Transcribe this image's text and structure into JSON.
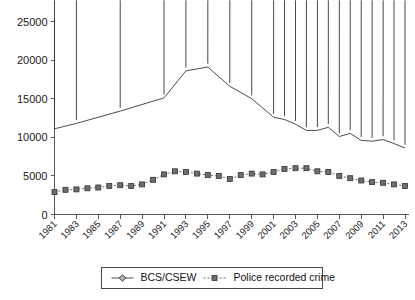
{
  "chart_data": {
    "type": "line",
    "title": "",
    "subtitle": "",
    "xlabel": "",
    "ylabel": "",
    "ylim": [
      0,
      25000
    ],
    "ytick_labels": [
      "0",
      "5000",
      "10000",
      "15000",
      "20000",
      "25000"
    ],
    "ytick_values": [
      0,
      5000,
      10000,
      15000,
      20000,
      25000
    ],
    "grid": false,
    "legend_position": "bottom-center",
    "x": [
      1981,
      1982,
      1983,
      1984,
      1985,
      1986,
      1987,
      1988,
      1989,
      1990,
      1991,
      1992,
      1993,
      1994,
      1995,
      1996,
      1997,
      1998,
      1999,
      2000,
      2001,
      2002,
      2003,
      2004,
      2005,
      2006,
      2007,
      2008,
      2009,
      2010,
      2011,
      2012,
      2013
    ],
    "xtick_labels": [
      "1981",
      "1983",
      "1985",
      "1987",
      "1989",
      "1991",
      "1993",
      "1995",
      "1997",
      "1999",
      "2001",
      "2003",
      "2005",
      "2007",
      "2009",
      "2011",
      "2013"
    ],
    "xtick_values": [
      1981,
      1983,
      1985,
      1987,
      1989,
      1991,
      1993,
      1995,
      1997,
      1999,
      2001,
      2003,
      2005,
      2007,
      2009,
      2011,
      2013
    ],
    "series": [
      {
        "name": "BCS/CSEW",
        "marker": "diamond",
        "line_style": "solid",
        "color": "#4d4d4d",
        "points": [
          {
            "x": 1981,
            "y": 11100
          },
          {
            "x": 1983,
            "y": 11800
          },
          {
            "x": 1987,
            "y": 13400
          },
          {
            "x": 1991,
            "y": 15100
          },
          {
            "x": 1993,
            "y": 18600
          },
          {
            "x": 1995,
            "y": 19100
          },
          {
            "x": 1997,
            "y": 16600
          },
          {
            "x": 1999,
            "y": 15000
          },
          {
            "x": 2001,
            "y": 12600
          },
          {
            "x": 2002,
            "y": 12300
          },
          {
            "x": 2003,
            "y": 11700
          },
          {
            "x": 2004,
            "y": 10900
          },
          {
            "x": 2005,
            "y": 10900
          },
          {
            "x": 2006,
            "y": 11300
          },
          {
            "x": 2007,
            "y": 10100
          },
          {
            "x": 2008,
            "y": 10500
          },
          {
            "x": 2009,
            "y": 9600
          },
          {
            "x": 2010,
            "y": 9500
          },
          {
            "x": 2011,
            "y": 9700
          },
          {
            "x": 2012,
            "y": 9200
          },
          {
            "x": 2013,
            "y": 8600
          }
        ]
      },
      {
        "name": "Police recorded crime",
        "marker": "square",
        "line_style": "dotted",
        "color": "#6e6e6e",
        "points": [
          {
            "x": 1981,
            "y": 2900
          },
          {
            "x": 1982,
            "y": 3200
          },
          {
            "x": 1983,
            "y": 3250
          },
          {
            "x": 1984,
            "y": 3400
          },
          {
            "x": 1985,
            "y": 3500
          },
          {
            "x": 1986,
            "y": 3700
          },
          {
            "x": 1987,
            "y": 3800
          },
          {
            "x": 1988,
            "y": 3700
          },
          {
            "x": 1989,
            "y": 3900
          },
          {
            "x": 1990,
            "y": 4500
          },
          {
            "x": 1991,
            "y": 5200
          },
          {
            "x": 1992,
            "y": 5600
          },
          {
            "x": 1993,
            "y": 5500
          },
          {
            "x": 1994,
            "y": 5300
          },
          {
            "x": 1995,
            "y": 5100
          },
          {
            "x": 1996,
            "y": 5000
          },
          {
            "x": 1997,
            "y": 4600
          },
          {
            "x": 1998,
            "y": 5100
          },
          {
            "x": 1999,
            "y": 5300
          },
          {
            "x": 2000,
            "y": 5200
          },
          {
            "x": 2001,
            "y": 5500
          },
          {
            "x": 2002,
            "y": 5900
          },
          {
            "x": 2003,
            "y": 6000
          },
          {
            "x": 2004,
            "y": 6000
          },
          {
            "x": 2005,
            "y": 5600
          },
          {
            "x": 2006,
            "y": 5500
          },
          {
            "x": 2007,
            "y": 5000
          },
          {
            "x": 2008,
            "y": 4700
          },
          {
            "x": 2009,
            "y": 4400
          },
          {
            "x": 2010,
            "y": 4200
          },
          {
            "x": 2011,
            "y": 4100
          },
          {
            "x": 2012,
            "y": 3900
          },
          {
            "x": 2013,
            "y": 3700
          }
        ]
      }
    ],
    "legend": [
      {
        "label": "BCS/CSEW",
        "marker": "diamond",
        "line_style": "solid"
      },
      {
        "label": "Police recorded crime",
        "marker": "square",
        "line_style": "dotted"
      }
    ]
  }
}
